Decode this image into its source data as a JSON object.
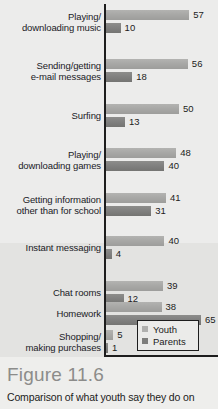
{
  "figure": {
    "title": "Figure 11.6",
    "caption": "Comparison of what youth say they do on"
  },
  "legend": {
    "items": [
      {
        "label": "Youth",
        "color": "#b0b0ae"
      },
      {
        "label": "Parents",
        "color": "#7e7e7c"
      }
    ]
  },
  "chart_data": {
    "type": "bar",
    "orientation": "horizontal",
    "title": "Figure 11.6",
    "subtitle": "Comparison of what youth say they do on",
    "xlabel": "",
    "ylabel": "",
    "xlim": [
      0,
      70
    ],
    "grid": false,
    "legend_position": "inside-bottom-right",
    "value_labels": true,
    "categories": [
      "Playing/ downloading music",
      "Sending/getting e-mail messages",
      "Surfing",
      "Playing/ downloading games",
      "Getting information other than for school",
      "Instant messaging",
      "Chat rooms",
      "Homework",
      "Shopping/ making purchases"
    ],
    "category_lines": [
      [
        "Playing/",
        "downloading music"
      ],
      [
        "Sending/getting",
        "e-mail messages"
      ],
      [
        "Surfing",
        ""
      ],
      [
        "Playing/",
        "downloading games"
      ],
      [
        "Getting information",
        "other than for school"
      ],
      [
        "Instant messaging",
        ""
      ],
      [
        "Chat rooms",
        ""
      ],
      [
        "Homework",
        ""
      ],
      [
        "Shopping/",
        "making purchases"
      ]
    ],
    "series": [
      {
        "name": "Youth",
        "color": "#a8a8a6",
        "values": [
          57,
          56,
          50,
          48,
          41,
          40,
          39,
          38,
          5
        ]
      },
      {
        "name": "Parents",
        "color": "#818180",
        "values": [
          10,
          18,
          13,
          40,
          31,
          4,
          12,
          65,
          1
        ]
      }
    ]
  }
}
